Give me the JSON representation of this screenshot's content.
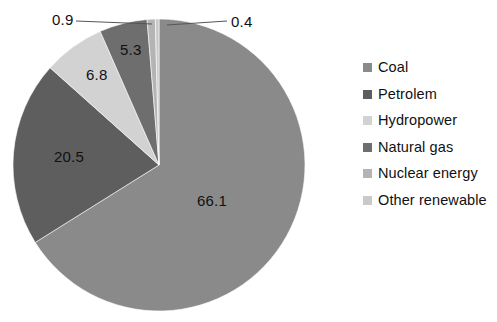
{
  "chart_data": {
    "type": "pie",
    "title": "",
    "subtitle": "",
    "xlabel": "",
    "ylabel": "",
    "grid": false,
    "legend_position": "right",
    "units": "percent",
    "start_angle_deg": 0,
    "direction": "clockwise",
    "categories": [
      "Coal",
      "Petrolem",
      "Hydropower",
      "Natural gas",
      "Nuclear energy",
      "Other renewable"
    ],
    "values": [
      66.1,
      20.5,
      6.8,
      5.3,
      0.9,
      0.4
    ],
    "labels": [
      "66.1",
      "20.5",
      "6.8",
      "5.3",
      "0.9",
      "0.4"
    ],
    "colors": [
      "#8a8a8a",
      "#5e5e5e",
      "#d2d2d2",
      "#6e6e6e",
      "#b4b4b4",
      "#c9c9c9"
    ],
    "slices": [
      {
        "name": "Coal",
        "value": 66.1,
        "label": "66.1",
        "color": "#8a8a8a",
        "label_placement": "inside",
        "leader_line": false
      },
      {
        "name": "Petrolem",
        "value": 20.5,
        "label": "20.5",
        "color": "#5e5e5e",
        "label_placement": "inside",
        "leader_line": false
      },
      {
        "name": "Hydropower",
        "value": 6.8,
        "label": "6.8",
        "color": "#d2d2d2",
        "label_placement": "inside",
        "leader_line": false
      },
      {
        "name": "Natural gas",
        "value": 5.3,
        "label": "5.3",
        "color": "#6e6e6e",
        "label_placement": "inside",
        "leader_line": false
      },
      {
        "name": "Nuclear energy",
        "value": 0.9,
        "label": "0.9",
        "color": "#b4b4b4",
        "label_placement": "outside",
        "leader_line": true
      },
      {
        "name": "Other renewable",
        "value": 0.4,
        "label": "0.4",
        "color": "#c9c9c9",
        "label_placement": "outside",
        "leader_line": true
      }
    ]
  },
  "legend": {
    "items": [
      {
        "label": "Coal",
        "color": "#8a8a8a"
      },
      {
        "label": "Petrolem",
        "color": "#5e5e5e"
      },
      {
        "label": "Hydropower",
        "color": "#d2d2d2"
      },
      {
        "label": "Natural gas",
        "color": "#6e6e6e"
      },
      {
        "label": "Nuclear energy",
        "color": "#b4b4b4"
      },
      {
        "label": "Other renewable",
        "color": "#c9c9c9"
      }
    ]
  },
  "labels": {
    "coal": "66.1",
    "petrolem": "20.5",
    "hydropower": "6.8",
    "natural_gas": "5.3",
    "nuclear_energy": "0.9",
    "other_renewable": "0.4"
  },
  "background_color": "#ffffff",
  "text_color": "#111111",
  "leader_line_color": "#555555"
}
